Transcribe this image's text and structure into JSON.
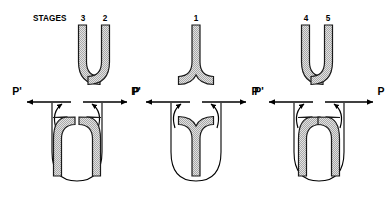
{
  "figure": {
    "caption_prefix": "STAGES",
    "background_color": "#ffffff",
    "line_color": "#000000",
    "tube_fill_color": "#d9d9d9",
    "tube_outline_color": "#1a1a1a",
    "chamber_outline_color": "#000000"
  },
  "axis": {
    "left_label": "P'",
    "right_label": "P"
  },
  "panels": [
    {
      "id": "panel-1",
      "stage_labels": [
        "3",
        "2"
      ],
      "upper_form": "double-outward-curving-tubes",
      "lower_form": "double-inward-curving-tubes-in-chamber",
      "axis": {
        "left_label": "P'",
        "right_label": "P"
      }
    },
    {
      "id": "panel-2",
      "stage_labels": [
        "1"
      ],
      "upper_form": "single-y-junction-tube",
      "lower_form": "inverted-y-junction-tube-in-chamber",
      "axis": {
        "left_label": "P'",
        "right_label": "P"
      }
    },
    {
      "id": "panel-3",
      "stage_labels": [
        "4",
        "5"
      ],
      "upper_form": "double-outward-curving-tubes",
      "lower_form": "double-inward-curving-tubes-in-chamber",
      "axis": {
        "left_label": "P'",
        "right_label": "P"
      }
    }
  ],
  "icons": {
    "arrow_left": "arrow-left-icon",
    "arrow_right": "arrow-right-icon",
    "curved_arrow_up": "curved-arrow-up-icon"
  }
}
